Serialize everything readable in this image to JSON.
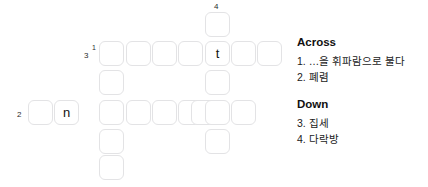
{
  "grid": {
    "cell_size": 25,
    "cells": [
      {
        "name": "cell-r0c4",
        "x": 205,
        "y": 12,
        "letter": ""
      },
      {
        "name": "cell-r1c0",
        "x": 99,
        "y": 41,
        "letter": ""
      },
      {
        "name": "cell-r1c1",
        "x": 126,
        "y": 41,
        "letter": ""
      },
      {
        "name": "cell-r1c2",
        "x": 152,
        "y": 41,
        "letter": ""
      },
      {
        "name": "cell-r1c3",
        "x": 178,
        "y": 41,
        "letter": ""
      },
      {
        "name": "cell-r1c4",
        "x": 205,
        "y": 41,
        "letter": "t"
      },
      {
        "name": "cell-r1c5",
        "x": 231,
        "y": 41,
        "letter": ""
      },
      {
        "name": "cell-r1c6",
        "x": 257,
        "y": 41,
        "letter": ""
      },
      {
        "name": "cell-r2c0",
        "x": 99,
        "y": 70,
        "letter": ""
      },
      {
        "name": "cell-r2c4",
        "x": 205,
        "y": 70,
        "letter": ""
      },
      {
        "name": "cell-r3m2",
        "x": 28,
        "y": 100,
        "letter": ""
      },
      {
        "name": "cell-r3m1",
        "x": 54,
        "y": 100,
        "letter": "n"
      },
      {
        "name": "cell-r3c0",
        "x": 99,
        "y": 100,
        "letter": ""
      },
      {
        "name": "cell-r3c1",
        "x": 126,
        "y": 100,
        "letter": ""
      },
      {
        "name": "cell-r3c2",
        "x": 152,
        "y": 100,
        "letter": ""
      },
      {
        "name": "cell-r3c3",
        "x": 178,
        "y": 100,
        "letter": ""
      },
      {
        "name": "cell-r3c35",
        "x": 191,
        "y": 100,
        "letter": ""
      },
      {
        "name": "cell-r3c4",
        "x": 205,
        "y": 100,
        "letter": ""
      },
      {
        "name": "cell-r3c5",
        "x": 231,
        "y": 100,
        "letter": ""
      },
      {
        "name": "cell-r4c0",
        "x": 99,
        "y": 129,
        "letter": ""
      },
      {
        "name": "cell-r4c4",
        "x": 205,
        "y": 129,
        "letter": ""
      },
      {
        "name": "cell-r5c0",
        "x": 99,
        "y": 155,
        "letter": ""
      }
    ],
    "numbers": [
      {
        "name": "grid-number-4",
        "text": "4",
        "x": 214,
        "y": 3,
        "sup": false
      },
      {
        "name": "grid-number-3",
        "text": "3",
        "x": 84,
        "y": 52,
        "sup": false
      },
      {
        "name": "grid-number-1",
        "text": "1",
        "x": 92,
        "y": 44,
        "sup": true
      },
      {
        "name": "grid-number-2",
        "text": "2",
        "x": 17,
        "y": 111,
        "sup": false
      }
    ]
  },
  "clues": {
    "across": {
      "heading": "Across",
      "items": [
        "1. …을 휘파람으로 불다",
        "2. 폐렴"
      ]
    },
    "down": {
      "heading": "Down",
      "items": [
        "3. 집세",
        "4. 다락방"
      ]
    }
  }
}
